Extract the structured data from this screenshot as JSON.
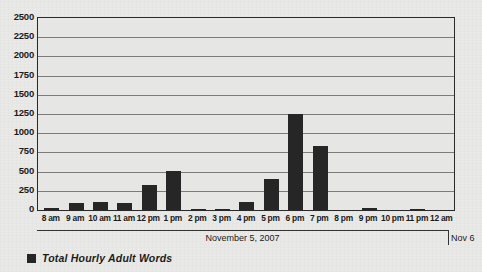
{
  "chart_data": {
    "type": "bar",
    "title": "",
    "subtitle": "",
    "xlabel": "November 5, 2007",
    "ylabel": "",
    "ylim": [
      0,
      2500
    ],
    "ytick_step": 250,
    "grid": true,
    "legend_position": "bottom-left",
    "bar_color": "#262626",
    "plot_background": "#e6e6e4",
    "figure_background": "#e9e9e7",
    "gridline_color": "#7b7b79",
    "axis_color": "#2a2a2a",
    "categories": [
      "8 am",
      "9 am",
      "10 am",
      "11 am",
      "12 pm",
      "1 pm",
      "2 pm",
      "3 pm",
      "4 pm",
      "5 pm",
      "6 pm",
      "7 pm",
      "8 pm",
      "9 pm",
      "10 pm",
      "11 pm",
      "12 am"
    ],
    "series": [
      {
        "name": "Total Hourly Adult Words",
        "values": [
          30,
          95,
          110,
          90,
          330,
          510,
          15,
          5,
          110,
          400,
          1250,
          840,
          0,
          20,
          0,
          15,
          0
        ]
      }
    ],
    "ytick_labels": [
      "2500",
      "2250",
      "2000",
      "1750",
      "1500",
      "1250",
      "1000",
      "750",
      "500",
      "250",
      "0"
    ],
    "ytick_values": [
      2500,
      2250,
      2000,
      1750,
      1500,
      1250,
      1000,
      750,
      500,
      250,
      0
    ],
    "annotations": {
      "date_main": "November 5, 2007",
      "date_next": "Nov 6"
    }
  },
  "legend": {
    "entries": [
      {
        "label": "Total Hourly Adult Words",
        "color": "#262626"
      }
    ]
  }
}
